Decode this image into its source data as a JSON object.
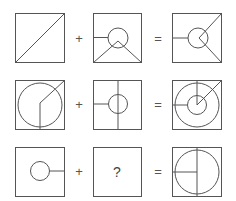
{
  "puzzle": {
    "operators": {
      "plus": "+",
      "equals": "="
    },
    "unknown_label": "?",
    "rows": [
      {
        "row": 1,
        "operand_a": "square with diagonal from bottom-left to top-right",
        "operand_b": "square with circle, line from left edge to circle, two lines from bottom corners to point inside circle",
        "result": "square with circle, line from left edge, lines from circle center to top-right and bottom-right corners"
      },
      {
        "row": 2,
        "operand_a": "square with large circle, line from bottom to center then to top-right corner",
        "operand_b": "square with small circle, vertical center line, horizontal line from left edge to circle",
        "result": "square with two concentric circles, lines from center to top, top-right corner, and left edge"
      },
      {
        "row": 3,
        "operand_a": "square with small circle and line from circle to right edge",
        "operand_b": "?",
        "result": "square with large circle, full vertical line through center, horizontal line from left edge to center"
      }
    ]
  },
  "colors": {
    "stroke": "#555555",
    "background": "#ffffff"
  }
}
